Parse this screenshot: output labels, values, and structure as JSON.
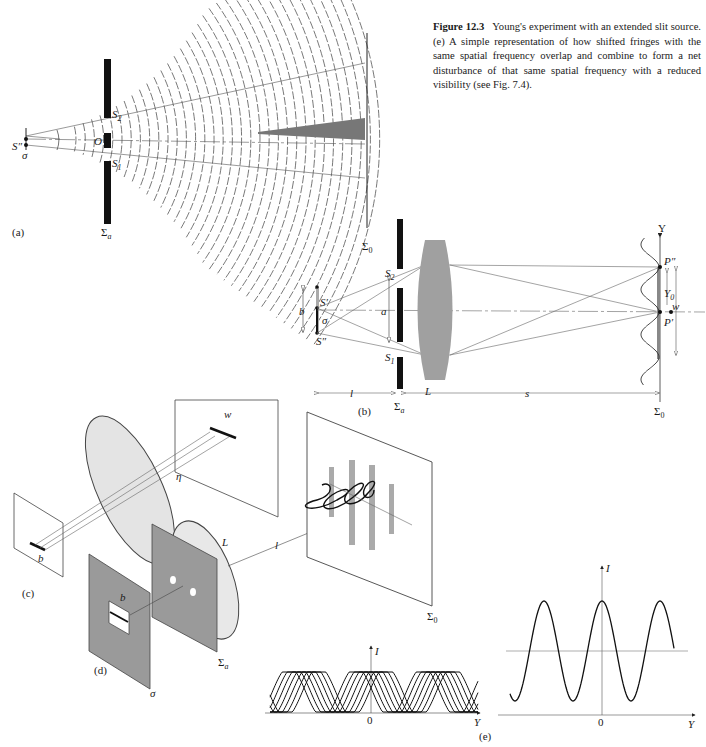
{
  "caption": {
    "figure_number": "Figure 12.3",
    "text": "Young's experiment with an extended slit source. (e) A simple representation of how shifted fringes with the same spatial frequency overlap and combine to form a net disturbance of that same spatial frequency with a reduced visibility (see Fig. 7.4)."
  },
  "panel_a": {
    "tag": "(a)",
    "source_label": "S″",
    "sigma_label": "σ",
    "slit2": "S",
    "slit2_sub": "2",
    "slit1": "S",
    "slit1_sub": "1",
    "center_label": "O",
    "aperture_screen": "Σ",
    "aperture_sub": "a",
    "obs_screen": "Σ",
    "obs_sub": "0"
  },
  "panel_b": {
    "tag": "(b)",
    "b_label": "b",
    "s_prime": "S′",
    "s_dprime": "S″",
    "sigma_label": "σ",
    "a_label": "a",
    "slit2": "S",
    "slit2_sub": "2",
    "slit1": "S",
    "slit1_sub": "1",
    "lens_label": "L",
    "l_label": "l",
    "s_label": "s",
    "aperture_screen": "Σ",
    "aperture_sub": "a",
    "obs_screen": "Σ",
    "obs_sub": "0",
    "y_axis": "Y",
    "p_dprime": "P″",
    "p_prime": "P′",
    "y0": "Y",
    "y0_sub": "0",
    "w_label": "w"
  },
  "panel_c": {
    "tag": "(c)",
    "w_label": "w",
    "eta_label": "η",
    "b_label": "b"
  },
  "panel_d": {
    "tag": "(d)",
    "b_label": "b",
    "sigma_label": "σ",
    "lens_label": "L",
    "l_label": "l",
    "aperture_screen": "Σ",
    "aperture_sub": "a",
    "obs_screen": "Σ",
    "obs_sub": "0"
  },
  "panel_e": {
    "tag": "(e)",
    "left_plot": {
      "y_axis": "I",
      "x_axis": "Y",
      "origin": "0",
      "curves": 7
    },
    "right_plot": {
      "y_axis": "I",
      "x_axis": "Y",
      "origin": "0"
    }
  }
}
